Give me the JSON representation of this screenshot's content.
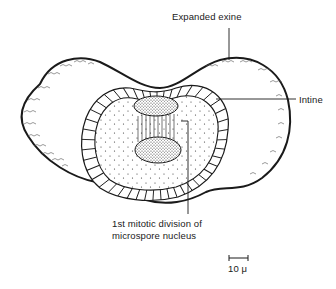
{
  "diagram": {
    "labels": {
      "expanded_exine": "Expanded exine",
      "intine": "Intine",
      "mitotic_line1": "1st mitotic division of",
      "mitotic_line2": "microspore nucleus"
    },
    "scale_bar": {
      "label": "10 μ"
    },
    "colors": {
      "ink": "#1a1a1a",
      "background": "#ffffff"
    }
  }
}
